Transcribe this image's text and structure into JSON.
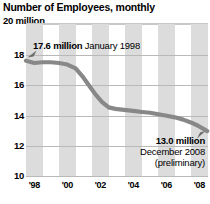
{
  "chart_data": {
    "type": "line",
    "title": "Number of Employees, monthly",
    "unit_label": "20 million",
    "xlabel": "",
    "ylabel": "",
    "ylim": [
      10,
      20
    ],
    "xlim": [
      1998,
      2009
    ],
    "grid": true,
    "legend": "none",
    "yticks": [
      "18",
      "16",
      "14",
      "12",
      "10"
    ],
    "ytick_values": [
      18,
      16,
      14,
      12,
      10
    ],
    "xticks": [
      "'98",
      "'00",
      "'02",
      "'04",
      "'06",
      "'08"
    ],
    "xtick_values": [
      1998,
      2000,
      2002,
      2004,
      2006,
      2008
    ],
    "series": [
      {
        "name": "Number of Employees",
        "x": [
          1998.0,
          1998.5,
          1999.0,
          1999.5,
          2000.0,
          2000.5,
          2001.0,
          2001.4,
          2001.8,
          2002.2,
          2002.6,
          2003.0,
          2003.4,
          2003.8,
          2004.2,
          2004.6,
          2005.0,
          2005.5,
          2006.0,
          2006.5,
          2007.0,
          2007.5,
          2008.0,
          2008.4,
          2008.8,
          2008.95
        ],
        "values": [
          17.6,
          17.45,
          17.5,
          17.5,
          17.45,
          17.35,
          17.1,
          16.6,
          16.0,
          15.4,
          14.9,
          14.55,
          14.45,
          14.4,
          14.35,
          14.3,
          14.25,
          14.2,
          14.1,
          14.0,
          13.9,
          13.75,
          13.55,
          13.35,
          13.1,
          13.0
        ]
      }
    ],
    "annotations": [
      {
        "id": "start",
        "value_text": "17.6 million",
        "period_text": "January 1998",
        "x": 1998.0,
        "y": 17.6
      },
      {
        "id": "end",
        "value_text": "13.0 million",
        "period_text": "December 2008",
        "note_text": "(preliminary)",
        "x": 2008.95,
        "y": 13.0
      }
    ],
    "colors": {
      "line": "#888888",
      "band": "#dcdcdc",
      "gridline": "#b9b9b9",
      "text": "#000000",
      "background": "#ffffff"
    }
  }
}
